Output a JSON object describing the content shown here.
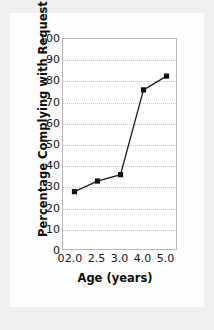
{
  "chart_data": {
    "type": "line",
    "title": "",
    "xlabel": "Age (years)",
    "ylabel": "Percentage Complying with Request",
    "x_tick_labels": [
      "0",
      "2.0",
      "2.5",
      "3.0",
      "4.0",
      "5.0"
    ],
    "categories": [
      "2.0",
      "2.5",
      "3.0",
      "4.0",
      "5.0"
    ],
    "values": [
      28,
      33,
      36,
      76,
      82.5
    ],
    "y_tick_labels": [
      "0",
      "10",
      "20",
      "30",
      "40",
      "50",
      "60",
      "70",
      "80",
      "90",
      "100"
    ],
    "ylim": [
      0,
      100
    ],
    "grid": "horizontal-dotted",
    "legend": "none",
    "marker": "square",
    "line_color": "#1b1b1b",
    "marker_color": "#101010",
    "grid_color": "#c9c9c9",
    "frame_color": "#b9b9b9",
    "series": [
      {
        "name": "Percentage Complying with Request",
        "points": [
          {
            "x": "2.0",
            "y": 28
          },
          {
            "x": "2.5",
            "y": 33
          },
          {
            "x": "3.0",
            "y": 36
          },
          {
            "x": "4.0",
            "y": 76
          },
          {
            "x": "5.0",
            "y": 82.5
          }
        ]
      }
    ]
  }
}
